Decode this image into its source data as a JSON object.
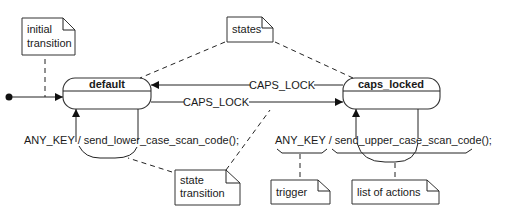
{
  "diagram": {
    "type": "uml-state-machine",
    "states": [
      {
        "id": "default",
        "name": "default"
      },
      {
        "id": "caps_locked",
        "name": "caps_locked"
      }
    ],
    "transitions": [
      {
        "from": "initial",
        "to": "default",
        "label": ""
      },
      {
        "from": "default",
        "to": "caps_locked",
        "label": "CAPS_LOCK"
      },
      {
        "from": "caps_locked",
        "to": "default",
        "label": "CAPS_LOCK"
      },
      {
        "from": "default",
        "to": "default",
        "label": "ANY_KEY / send_lower_case_scan_code();"
      },
      {
        "from": "caps_locked",
        "to": "caps_locked",
        "label": "ANY_KEY / send_upper_case_scan_code();"
      }
    ],
    "notes": {
      "initial_line1": "initial",
      "initial_line2": "transition",
      "states": "states",
      "state_transition_line1": "state",
      "state_transition_line2": "transition",
      "trigger": "trigger",
      "list_of_actions": "list of actions"
    },
    "labels": {
      "caps_lock_top": "CAPS_LOCK",
      "caps_lock_bottom": "CAPS_LOCK",
      "lower_trigger": "ANY_KEY",
      "lower_sep": "/",
      "lower_action": "send_lower_case_scan_code();",
      "upper_trigger": "ANY_KEY",
      "upper_sep": "/",
      "upper_action": "send_upper_case_scan_code();"
    }
  }
}
